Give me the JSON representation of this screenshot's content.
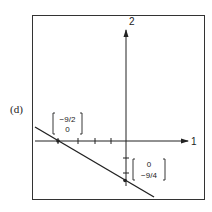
{
  "figure": {
    "panel_label": "(d)",
    "y_axis_label": "2",
    "x_axis_label": "1",
    "x_intercept": {
      "top": "−9/2",
      "bottom": "0"
    },
    "y_intercept": {
      "top": "0",
      "bottom": "−9/4"
    },
    "colors": {
      "ink": "#222222",
      "background": "#ffffff"
    }
  }
}
